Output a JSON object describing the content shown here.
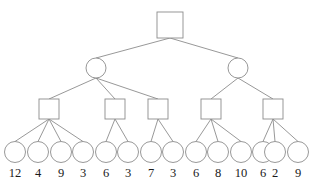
{
  "diagram": {
    "type": "tree",
    "title": "",
    "canvas": {
      "width": 313,
      "height": 183,
      "background": "#ffffff"
    },
    "style": {
      "line_color": "#8c8c8c",
      "node_fill": "#ffffff",
      "node_stroke": "#8c8c8c",
      "label_color": "#1a1a1a"
    },
    "levels": [
      {
        "index": 0,
        "shape": "square",
        "count": 1
      },
      {
        "index": 1,
        "shape": "circle",
        "count": 2
      },
      {
        "index": 2,
        "shape": "square",
        "count": 5
      },
      {
        "index": 3,
        "shape": "circle",
        "count": 14
      }
    ],
    "nodes": {
      "root": {
        "id": "r0",
        "shape": "square",
        "cx": 170,
        "cy": 25,
        "size": 26,
        "label": ""
      },
      "level1": [
        {
          "id": "c0",
          "shape": "circle",
          "cx": 96,
          "cy": 68,
          "r": 10,
          "label": ""
        },
        {
          "id": "c1",
          "shape": "circle",
          "cx": 238,
          "cy": 68,
          "r": 10,
          "label": ""
        }
      ],
      "level2": [
        {
          "id": "s0",
          "shape": "square",
          "cx": 49,
          "cy": 109,
          "size": 20,
          "label": ""
        },
        {
          "id": "s1",
          "shape": "square",
          "cx": 115,
          "cy": 109,
          "size": 20,
          "label": ""
        },
        {
          "id": "s2",
          "shape": "square",
          "cx": 158,
          "cy": 109,
          "size": 20,
          "label": ""
        },
        {
          "id": "s3",
          "shape": "square",
          "cx": 211,
          "cy": 109,
          "size": 20,
          "label": ""
        },
        {
          "id": "s4",
          "shape": "square",
          "cx": 273,
          "cy": 109,
          "size": 20,
          "label": ""
        }
      ],
      "leaves": [
        {
          "id": "l0",
          "cx": 15,
          "cy": 152,
          "r": 10.5,
          "label": "12"
        },
        {
          "id": "l1",
          "cx": 38,
          "cy": 152,
          "r": 10.5,
          "label": "4"
        },
        {
          "id": "l2",
          "cx": 61,
          "cy": 152,
          "r": 10.5,
          "label": "9"
        },
        {
          "id": "l3",
          "cx": 83,
          "cy": 152,
          "r": 10.5,
          "label": "3"
        },
        {
          "id": "l4",
          "cx": 106,
          "cy": 152,
          "r": 10.5,
          "label": "6"
        },
        {
          "id": "l5",
          "cx": 128,
          "cy": 152,
          "r": 10.5,
          "label": "3"
        },
        {
          "id": "l6",
          "cx": 151,
          "cy": 152,
          "r": 10.5,
          "label": "7"
        },
        {
          "id": "l7",
          "cx": 173,
          "cy": 152,
          "r": 10.5,
          "label": "3"
        },
        {
          "id": "l8",
          "cx": 196,
          "cy": 152,
          "r": 10.5,
          "label": "6"
        },
        {
          "id": "l9",
          "cx": 218,
          "cy": 152,
          "r": 10.5,
          "label": "8"
        },
        {
          "id": "l10",
          "cx": 241,
          "cy": 152,
          "r": 10.5,
          "label": "10"
        },
        {
          "id": "l11",
          "cx": 263,
          "cy": 152,
          "r": 10.5,
          "label": "6"
        },
        {
          "id": "l12",
          "cx": 275,
          "cy": 152,
          "r": 10.5,
          "label": "2"
        },
        {
          "id": "l13",
          "cx": 298,
          "cy": 152,
          "r": 10.5,
          "label": "9"
        }
      ]
    },
    "edges": [
      {
        "from": "r0",
        "to": "c0"
      },
      {
        "from": "r0",
        "to": "c1"
      },
      {
        "from": "c0",
        "to": "s0"
      },
      {
        "from": "c0",
        "to": "s1"
      },
      {
        "from": "c0",
        "to": "s2"
      },
      {
        "from": "c1",
        "to": "s3"
      },
      {
        "from": "c1",
        "to": "s4"
      },
      {
        "from": "s0",
        "to": "l0"
      },
      {
        "from": "s0",
        "to": "l1"
      },
      {
        "from": "s0",
        "to": "l2"
      },
      {
        "from": "s0",
        "to": "l3"
      },
      {
        "from": "s1",
        "to": "l4"
      },
      {
        "from": "s1",
        "to": "l5"
      },
      {
        "from": "s2",
        "to": "l6"
      },
      {
        "from": "s2",
        "to": "l7"
      },
      {
        "from": "s3",
        "to": "l8"
      },
      {
        "from": "s3",
        "to": "l9"
      },
      {
        "from": "s3",
        "to": "l10"
      },
      {
        "from": "s4",
        "to": "l11"
      },
      {
        "from": "s4",
        "to": "l12"
      },
      {
        "from": "s4",
        "to": "l13"
      }
    ],
    "leaf_values": [
      12,
      4,
      9,
      3,
      6,
      3,
      7,
      3,
      6,
      8,
      10,
      6,
      2,
      9
    ]
  }
}
